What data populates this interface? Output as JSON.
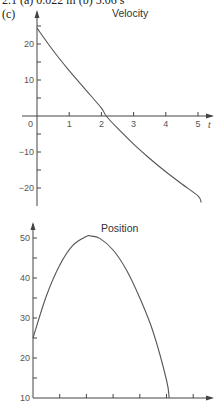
{
  "header": {
    "cutoff_text": "2.1 (a) 0.022 m (b) 5.06 s",
    "part_label": "(c)"
  },
  "chart_data": [
    {
      "type": "line",
      "title": "Velocity",
      "xlabel": "t",
      "ylabel": "",
      "xlim": [
        0,
        5.3
      ],
      "ylim": [
        -25,
        27
      ],
      "x_ticks": [
        0,
        1,
        2,
        3,
        4,
        5
      ],
      "x_tick_labels": [
        "0",
        "1",
        "2",
        "3",
        "4",
        "5"
      ],
      "y_ticks": [
        -20,
        -15,
        -10,
        -5,
        0,
        5,
        10,
        15,
        20,
        25
      ],
      "y_tick_labels": [
        "-20",
        "-10",
        "10",
        "20"
      ],
      "grid": false,
      "series": [
        {
          "name": "velocity",
          "x": [
            0,
            0.5,
            1,
            1.5,
            2,
            2.15,
            2.5,
            3,
            3.5,
            4,
            4.5,
            5,
            5.1
          ],
          "y": [
            24.4,
            18.2,
            12.6,
            7.4,
            2.2,
            0,
            -3.4,
            -7.8,
            -11.8,
            -15.5,
            -18.9,
            -22.2,
            -24
          ]
        }
      ]
    },
    {
      "type": "line",
      "title": "Position",
      "xlabel": "",
      "ylabel": "",
      "xlim": [
        0,
        6.5
      ],
      "ylim": [
        10,
        52
      ],
      "x_ticks": [
        0,
        1,
        2,
        3,
        4,
        5,
        6
      ],
      "y_ticks": [
        10,
        15,
        20,
        25,
        30,
        35,
        40,
        45,
        50
      ],
      "y_tick_labels": [
        "10",
        "20",
        "30",
        "40",
        "50"
      ],
      "grid": false,
      "series": [
        {
          "name": "position",
          "x": [
            0,
            0.5,
            1,
            1.5,
            2,
            2.15,
            2.5,
            3,
            3.5,
            4,
            4.5,
            5,
            5.1
          ],
          "y": [
            25,
            35.5,
            43.2,
            48.2,
            50.4,
            50.5,
            49.9,
            47,
            42,
            35,
            26.5,
            14.5,
            10
          ]
        }
      ]
    }
  ]
}
